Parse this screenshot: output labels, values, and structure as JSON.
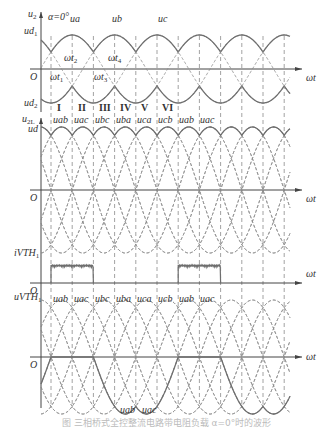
{
  "figure": {
    "caption": "图 三相桥式全控整流电路带电阻负载 α=0°时的波形",
    "colors": {
      "solid": "#6e6e6e",
      "dashed": "#8a8a8a",
      "axis": "#444444",
      "text": "#333333"
    },
    "x_axis_label": "ωt",
    "origin_label": "O",
    "alpha_label": "α=0°",
    "panels": [
      {
        "id": "phase-voltages",
        "y_labels": [
          "u2",
          "ud1",
          "ud2"
        ],
        "curve_labels": [
          "ua",
          "ub",
          "uc"
        ],
        "time_markers": [
          "ωt1",
          "ωt2",
          "ωt3",
          "ωt4"
        ]
      },
      {
        "id": "line-voltages-ud",
        "y_labels": [
          "u2L",
          "ud"
        ],
        "intervals": [
          "I",
          "II",
          "III",
          "IV",
          "V",
          "VI"
        ],
        "segment_labels": [
          "uab",
          "uac",
          "ubc",
          "uba",
          "uca",
          "ucb",
          "uab",
          "uac"
        ]
      },
      {
        "id": "thyristor-current",
        "y_labels": [
          "iVTH1"
        ]
      },
      {
        "id": "thyristor-voltage",
        "y_labels": [
          "uVTH1"
        ],
        "segment_labels": [
          "uab",
          "uac",
          "ubc",
          "uba",
          "uca",
          "ucb",
          "uab",
          "uac"
        ],
        "bottom_labels": [
          "uab",
          "uac"
        ]
      }
    ]
  }
}
